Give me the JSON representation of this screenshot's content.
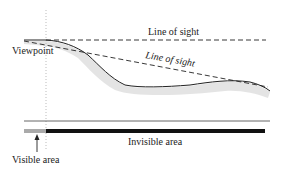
{
  "diagram": {
    "labels": {
      "viewpoint": "Viewpoint",
      "line_of_sight_horizontal": "Line of sight",
      "line_of_sight_sloped": "Line of sight",
      "invisible_area": "Invisible area",
      "visible_area": "Visible area"
    },
    "colors": {
      "stroke": "#222222",
      "visible_bar": "#aaaaaa",
      "invisible_bar": "#111111",
      "terrain_hatch": "#bbbbbb",
      "guide_line": "#999999"
    }
  }
}
